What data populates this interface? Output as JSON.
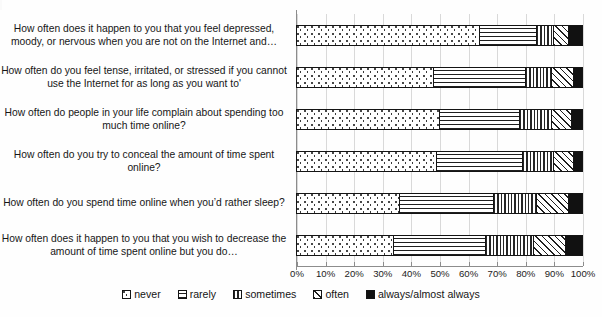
{
  "chart_data": {
    "type": "bar",
    "orientation": "horizontal",
    "stacked": true,
    "title": "",
    "xlabel": "",
    "ylabel": "",
    "xlim": [
      0,
      100
    ],
    "xtick_labels": [
      "0%",
      "10%",
      "20%",
      "30%",
      "40%",
      "50%",
      "60%",
      "70%",
      "80%",
      "90%",
      "100%"
    ],
    "xticks": [
      0,
      10,
      20,
      30,
      40,
      50,
      60,
      70,
      80,
      90,
      100
    ],
    "grid": true,
    "legend_position": "bottom",
    "categories": [
      "How often does it happen to you that you feel depressed, moody, or nervous when you are not on the Internet and…",
      "How often do you feel tense, irritated, or stressed if you cannot use the Internet for as long as you want to'",
      "How often do people in your life complain about spending too much time online?",
      "How often do you try to conceal the amount of time spent online?",
      "How often do you spend time online when you’d rather sleep?",
      "How often does it happen to you that you wish to decrease the amount of time spent online but you do…"
    ],
    "series": [
      {
        "name": "never",
        "pattern": "dotted",
        "values": [
          64,
          48,
          50,
          49,
          36,
          34
        ]
      },
      {
        "name": "rarely",
        "pattern": "horizontal-lines",
        "values": [
          20,
          32,
          28,
          30,
          33,
          32
        ]
      },
      {
        "name": "sometimes",
        "pattern": "vertical-lines",
        "values": [
          6,
          9,
          11,
          11,
          15,
          17
        ]
      },
      {
        "name": "often",
        "pattern": "diagonal-hatch",
        "values": [
          5,
          8,
          7,
          7,
          11,
          11
        ]
      },
      {
        "name": "always/almost always",
        "pattern": "dense-dark",
        "values": [
          5,
          3,
          4,
          3,
          5,
          6
        ]
      }
    ]
  },
  "legend": {
    "items": [
      {
        "label": "never"
      },
      {
        "label": "rarely"
      },
      {
        "label": "sometimes"
      },
      {
        "label": "often"
      },
      {
        "label": "always/almost always"
      }
    ]
  }
}
